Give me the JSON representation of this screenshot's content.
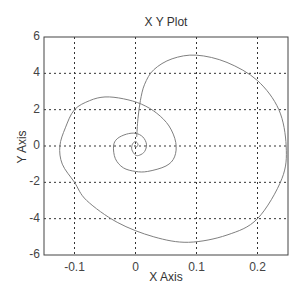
{
  "chart_data": {
    "type": "line",
    "title": "X Y Plot",
    "xlabel": "X Axis",
    "ylabel": "Y Axis",
    "xlim": [
      -0.15,
      0.25
    ],
    "ylim": [
      -6,
      6
    ],
    "xticks": [
      "-0.1",
      "0",
      "0.1",
      "0.2"
    ],
    "yticks": [
      "6",
      "4",
      "2",
      "0",
      "-2",
      "-4",
      "-6"
    ],
    "grid": true,
    "legend": null,
    "series": [
      {
        "name": "spiral",
        "color": "#808080",
        "x": [
          0.002,
          0.004,
          0.008,
          0.015,
          0.03,
          0.06,
          0.1,
          0.15,
          0.2,
          0.235,
          0.247,
          0.24,
          0.2,
          0.15,
          0.087,
          0.03,
          -0.03,
          -0.08,
          -0.1,
          -0.12,
          -0.124,
          -0.115,
          -0.1,
          -0.075,
          -0.05,
          -0.02,
          0.01,
          0.035,
          0.055,
          0.066,
          0.064,
          0.05,
          0.02,
          0.0,
          -0.02,
          -0.033,
          -0.036,
          -0.03,
          -0.015,
          0.0,
          0.012,
          0.018,
          0.015,
          0.007,
          0.0,
          -0.006,
          -0.005,
          0.0,
          0.004,
          0.002,
          0.0
        ],
        "y": [
          0.5,
          1.5,
          2.5,
          3.4,
          4.2,
          4.8,
          5.0,
          4.6,
          3.6,
          2.0,
          0.0,
          -1.8,
          -4.0,
          -4.9,
          -5.3,
          -5.0,
          -4.2,
          -3.0,
          -2.0,
          -1.0,
          0.0,
          1.0,
          2.0,
          2.5,
          2.7,
          2.6,
          2.3,
          1.8,
          1.1,
          0.2,
          -0.6,
          -1.1,
          -1.4,
          -1.4,
          -1.2,
          -0.7,
          0.0,
          0.4,
          0.65,
          0.7,
          0.5,
          0.1,
          -0.3,
          -0.5,
          -0.5,
          -0.2,
          0.1,
          0.25,
          0.1,
          -0.05,
          0.0
        ]
      }
    ]
  }
}
